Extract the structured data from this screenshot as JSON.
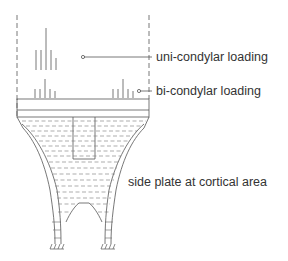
{
  "labels": {
    "uni": "uni-condylar loading",
    "bi": "bi-condylar loading",
    "side": "side plate at cortical area"
  },
  "colors": {
    "line": "#555555",
    "text": "#333333"
  }
}
